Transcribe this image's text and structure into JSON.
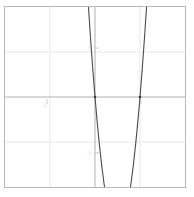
{
  "figure": {
    "title": "",
    "background_color": "#ffffff",
    "frame_color": "#b9b9b9",
    "grid_color": "#e8e8e8",
    "axis_color": "#b0b0b0",
    "curve_color": "#4a4a4a"
  },
  "chart_data": {
    "type": "line",
    "title": "",
    "xlabel": "",
    "ylabel": "",
    "xlim": [
      -2.0,
      2.0
    ],
    "ylim": [
      -2.0,
      2.0
    ],
    "grid": true,
    "legend_position": "none",
    "function": "y = 12x^2 - 12x",
    "xticks": [
      -1,
      0,
      1
    ],
    "xtick_labels": [
      "-1",
      "0",
      "1"
    ],
    "yticks": [
      -1,
      0,
      1
    ],
    "ytick_labels": [
      "-1",
      "0",
      "1"
    ],
    "roots": [
      0,
      1
    ],
    "vertex": [
      0.5,
      -3
    ],
    "series": [
      {
        "name": "y = 12x^2 - 12x",
        "x": [
          -0.19,
          -0.15,
          -0.1,
          -0.05,
          0.0,
          0.05,
          0.1,
          0.15,
          0.2,
          0.25,
          0.3,
          0.35,
          0.4,
          0.45,
          0.5,
          0.55,
          0.6,
          0.65,
          0.7,
          0.75,
          0.8,
          0.85,
          0.9,
          0.95,
          1.0,
          1.05,
          1.1,
          1.15,
          1.19
        ],
        "y": [
          2.71,
          2.07,
          1.32,
          0.63,
          0.0,
          -0.57,
          -1.08,
          -1.53,
          -1.92,
          -2.25,
          -2.52,
          -2.73,
          -2.88,
          -2.97,
          -3.0,
          -2.97,
          -2.88,
          -2.73,
          -2.52,
          -2.25,
          -1.92,
          -1.53,
          -1.08,
          -0.57,
          0.0,
          0.63,
          1.32,
          2.07,
          2.71
        ]
      }
    ]
  }
}
